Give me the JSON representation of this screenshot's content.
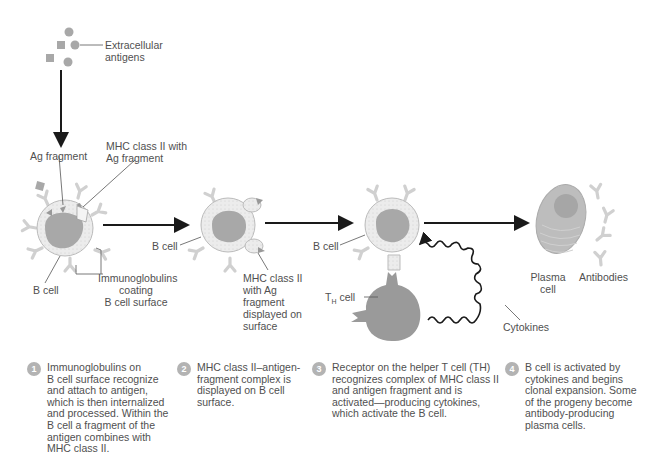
{
  "labels": {
    "extracellular_antigens": [
      "Extracellular",
      "antigens"
    ],
    "ag_fragment": "Ag fragment",
    "mhc_with_ag": [
      "MHC class II with",
      "Ag fragment"
    ],
    "b_cell_1": "B cell",
    "immunoglobulins": [
      "Immunoglobulins",
      "coating",
      "B cell surface"
    ],
    "b_cell_2": "B cell",
    "mhc_displayed": [
      "MHC class II",
      "with Ag",
      "fragment",
      "displayed on",
      "surface"
    ],
    "b_cell_3": "B cell",
    "th_cell": "T",
    "th_sub": "H",
    "th_cell_suffix": " cell",
    "cytokines": "Cytokines",
    "plasma_cell": [
      "Plasma",
      "cell"
    ],
    "antibodies": "Antibodies"
  },
  "steps": [
    {
      "num": "1",
      "text": "Immunoglobulins on\nB cell surface recognize\nand attach to antigen,\nwhich is then internalized\nand processed. Within the\nB cell a fragment of the\nantigen combines with\nMHC class II."
    },
    {
      "num": "2",
      "text": "MHC class II–antigen-\nfragment complex is\ndisplayed on B cell\nsurface."
    },
    {
      "num": "3",
      "text": "Receptor on the helper T cell (TH)\nrecognizes complex of MHC class II\nand antigen fragment and is\nactivated—producing cytokines,\nwhich activate the B cell."
    },
    {
      "num": "4",
      "text": "B cell is activated by\ncytokines and begins\nclonal expansion. Some\nof the progeny become\nantibody-producing\nplasma cells."
    }
  ],
  "colors": {
    "cell_body": "#e9e9e9",
    "nucleus": "#a8a8a8",
    "th_cell": "#9a9a9a",
    "antibody": "#d6d6d6",
    "arrow": "#1a1a1a",
    "label_line": "#555555",
    "step_badge": "#b3b3b3"
  }
}
